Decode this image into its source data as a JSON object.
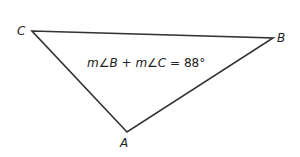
{
  "diagram": {
    "type": "triangle",
    "vertices": {
      "A": {
        "label": "A",
        "x": 127,
        "y": 132
      },
      "B": {
        "label": "B",
        "x": 273,
        "y": 38
      },
      "C": {
        "label": "C",
        "x": 32,
        "y": 31
      }
    },
    "equation": {
      "m1": "m",
      "angle1": "∠",
      "v1": "B",
      "plus": " + ",
      "m2": "m",
      "angle2": "∠",
      "v2": "C",
      "rhs": " = 88°"
    },
    "colors": {
      "stroke": "#333333",
      "text": "#222222"
    }
  }
}
